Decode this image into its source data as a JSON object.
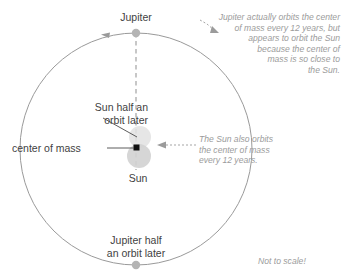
{
  "diagram": {
    "colors": {
      "orbit_line": "#9a9a9a",
      "jupiter_dot": "#b4b4b4",
      "sun_body": "#d4d4d4",
      "sun_later_body": "#e2e2e2",
      "center_of_mass": "#111111",
      "dashed_axis": "#b0b0b0",
      "label_text": "#3f3f3f",
      "note_text": "#9b9b9b",
      "leader_line": "#4a4a4a"
    },
    "labels": {
      "jupiter": "Jupiter",
      "sun": "Sun",
      "sun_half_orbit_later": "Sun half an\norbit later",
      "center_of_mass": "center of mass",
      "jupiter_half_orbit_later": "Jupiter half\nan orbit later"
    },
    "notes": {
      "jupiter_note": "Jupiter actually orbits the center\nof mass every 12 years, but\nappears to orbit the Sun\nbecause the center of\nmass is so close to\nthe Sun.",
      "sun_note": "The Sun also orbits\nthe center of mass\nevery 12 years.",
      "scale_note": "Not to scale!"
    },
    "geometry": {
      "orbit_center_x": 136,
      "orbit_center_y": 149,
      "orbit_radius": 116,
      "jupiter_dot_x": 136,
      "jupiter_dot_y": 33,
      "jupiter_half_dot_x": 136,
      "jupiter_half_dot_y": 265,
      "sun_circle_x": 139,
      "sun_circle_y": 156,
      "sun_circle_r": 12,
      "sun_later_circle_x": 140,
      "sun_later_circle_y": 137,
      "sun_later_circle_r": 11,
      "center_of_mass_x": 137,
      "center_of_mass_y": 148
    }
  }
}
